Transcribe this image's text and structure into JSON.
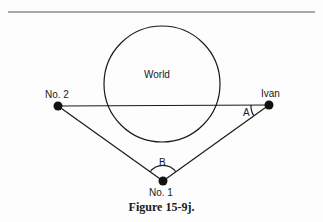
{
  "figure": {
    "caption": "Figure 15-9j.",
    "labels": {
      "world": "World",
      "no2": "No. 2",
      "ivan": "Ivan",
      "no1": "No. 1",
      "angle_a": "A",
      "angle_b": "B"
    },
    "points": {
      "no2": [
        58,
        106
      ],
      "ivan": [
        269,
        105
      ],
      "no1": [
        163,
        181
      ]
    },
    "circle": {
      "cx": 162,
      "cy": 84,
      "r": 58
    },
    "colors": {
      "ink": "#1a1a1a",
      "background": "#fdfdfd"
    }
  }
}
